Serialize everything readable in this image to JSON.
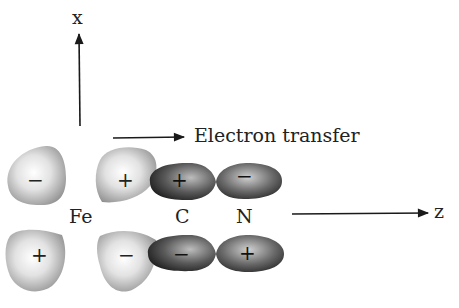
{
  "axes": {
    "x_label": "x",
    "z_label": "z"
  },
  "annotation": {
    "electron_transfer": "Electron transfer"
  },
  "atoms": {
    "fe": "Fe",
    "c": "C",
    "n": "N"
  },
  "lobes": {
    "fe_left_top_sign": "−",
    "fe_left_bottom_sign": "+",
    "fe_right_top_sign": "+",
    "fe_right_bottom_sign": "−",
    "c_top_sign": "+",
    "c_bottom_sign": "−",
    "n_top_sign": "−",
    "n_bottom_sign": "+"
  },
  "colors": {
    "d_lobe_light": "#f4f4f4",
    "d_lobe_dark": "#9a9a9a",
    "p_lobe_light": "#c8c8c8",
    "p_lobe_dark": "#2a2a2a",
    "ink": "#1a1a1a"
  }
}
